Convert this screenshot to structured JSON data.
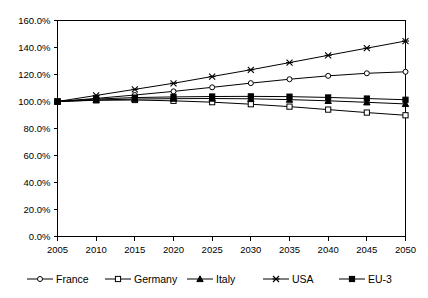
{
  "chart_data": {
    "type": "line",
    "title": "",
    "subtitle": "",
    "xlabel": "",
    "ylabel": "",
    "x": [
      2005,
      2010,
      2015,
      2020,
      2025,
      2030,
      2035,
      2040,
      2045,
      2050
    ],
    "xtick_labels": [
      "2005",
      "2010",
      "2015",
      "2020",
      "2025",
      "2030",
      "2035",
      "2040",
      "2045",
      "2050"
    ],
    "ytick_labels": [
      "0.0%",
      "20.0%",
      "40.0%",
      "60.0%",
      "80.0%",
      "100.0%",
      "120.0%",
      "140.0%",
      "160.0%"
    ],
    "ytick_values": [
      0,
      20,
      40,
      60,
      80,
      100,
      120,
      140,
      160
    ],
    "ylim": [
      0,
      160
    ],
    "xlim": [
      2005,
      2050
    ],
    "grid": false,
    "legend_position": "bottom",
    "series": [
      {
        "name": "France",
        "marker": "open-circle",
        "values": [
          100.0,
          102.3,
          104.8,
          107.5,
          110.5,
          113.6,
          116.5,
          119.0,
          120.9,
          122.0
        ]
      },
      {
        "name": "Germany",
        "marker": "open-square",
        "values": [
          100.0,
          100.9,
          101.1,
          100.5,
          99.5,
          98.0,
          96.2,
          94.0,
          91.8,
          89.8
        ]
      },
      {
        "name": "Italy",
        "marker": "solid-triangle",
        "values": [
          100.0,
          101.1,
          101.8,
          102.1,
          102.2,
          102.0,
          101.4,
          100.5,
          99.4,
          98.2
        ]
      },
      {
        "name": "USA",
        "marker": "cross",
        "values": [
          100.0,
          104.5,
          109.0,
          113.5,
          118.5,
          123.5,
          128.8,
          134.2,
          139.5,
          144.8
        ]
      },
      {
        "name": "EU-3",
        "marker": "solid-square",
        "values": [
          100.0,
          101.8,
          102.9,
          103.4,
          103.7,
          103.8,
          103.6,
          103.0,
          102.2,
          101.3
        ]
      }
    ]
  },
  "legend": {
    "items": [
      {
        "label": "France"
      },
      {
        "label": "Germany"
      },
      {
        "label": "Italy"
      },
      {
        "label": "USA"
      },
      {
        "label": "EU-3"
      }
    ]
  }
}
